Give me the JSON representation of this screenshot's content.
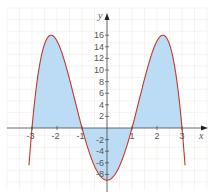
{
  "chart_data": {
    "type": "area",
    "title": "",
    "function": "f(x) = -x^4 + 10x^2 - 9",
    "xlabel": "x",
    "ylabel": "y",
    "xlim": [
      -4,
      4
    ],
    "ylim": [
      -10,
      18
    ],
    "x_ticks": [
      -3,
      -2,
      -1,
      1,
      2,
      3
    ],
    "x_tick_labels": [
      "-3",
      "-2",
      "-1",
      "1",
      "2",
      "3"
    ],
    "y_ticks": [
      16,
      14,
      12,
      10,
      8,
      6,
      4,
      2,
      -2,
      -4,
      -6,
      -8
    ],
    "y_tick_labels": [
      "16",
      "14",
      "12",
      "10",
      "8",
      "6",
      "4",
      "2",
      "-2",
      "-4",
      "-6",
      "-8"
    ],
    "grid": true,
    "legend": null,
    "roots": [
      -3,
      -1,
      1,
      3
    ],
    "maxima": [
      {
        "x": -2.236,
        "y": 16
      },
      {
        "x": 2.236,
        "y": 16
      }
    ],
    "minimum": {
      "x": 0,
      "y": -9
    },
    "shaded_region": {
      "from": -3,
      "to": 3,
      "description": "area between curve and x-axis"
    },
    "x": [
      -3,
      -2.5,
      -2.236,
      -2,
      -1.5,
      -1,
      -0.5,
      0,
      0.5,
      1,
      1.5,
      2,
      2.236,
      2.5,
      3
    ],
    "values": [
      0,
      14.44,
      16,
      15,
      8.44,
      0,
      -6.56,
      -9,
      -6.56,
      0,
      8.44,
      15,
      16,
      14.44,
      0
    ],
    "colors": {
      "curve": "#c0392b",
      "fill": "#bcdcf5",
      "axis": "#444444",
      "grid": "#f0ede6"
    }
  }
}
